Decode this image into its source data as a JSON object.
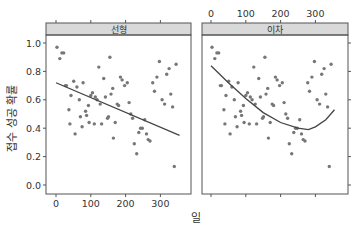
{
  "chart_data": {
    "type": "scatter",
    "title": "",
    "xlabel": "일",
    "ylabel": "접수 성공 확률",
    "xlim": [
      -30,
      385
    ],
    "ylim": [
      -0.05,
      1.08
    ],
    "x_ticks": [
      0,
      100,
      200,
      300
    ],
    "y_ticks": [
      0.0,
      0.2,
      0.4,
      0.6,
      0.8,
      1.0
    ],
    "y_tick_labels": [
      "0.0",
      "0.2",
      "0.4",
      "0.6",
      "0.8",
      "1.0"
    ],
    "grid": false,
    "panels": [
      {
        "name": "선형",
        "fit": "linear",
        "fit_line": {
          "x": [
            0,
            355
          ],
          "y": [
            0.72,
            0.35
          ]
        }
      },
      {
        "name": "이차",
        "fit": "quadratic",
        "fit_curve": {
          "x": [
            0,
            50,
            100,
            150,
            200,
            250,
            280,
            300,
            330,
            355
          ],
          "y": [
            0.84,
            0.72,
            0.61,
            0.51,
            0.44,
            0.4,
            0.39,
            0.41,
            0.46,
            0.53
          ]
        }
      }
    ],
    "points": {
      "x": [
        3,
        11,
        17,
        22,
        27,
        30,
        37,
        40,
        43,
        51,
        55,
        60,
        67,
        70,
        75,
        78,
        85,
        88,
        93,
        95,
        100,
        105,
        110,
        113,
        118,
        123,
        127,
        131,
        137,
        142,
        148,
        151,
        155,
        158,
        163,
        165,
        170,
        176,
        180,
        185,
        190,
        197,
        205,
        210,
        215,
        220,
        225,
        232,
        238,
        243,
        248,
        255,
        260,
        265,
        270,
        278,
        283,
        290,
        297,
        305,
        312,
        318,
        325,
        330,
        335,
        340,
        345
      ],
      "y": [
        0.97,
        0.89,
        0.93,
        0.93,
        0.7,
        0.7,
        0.53,
        0.43,
        0.63,
        0.73,
        0.36,
        0.69,
        0.6,
        0.48,
        0.41,
        0.72,
        0.52,
        0.49,
        0.56,
        0.44,
        0.63,
        0.65,
        0.43,
        0.62,
        0.6,
        0.83,
        0.57,
        0.43,
        0.75,
        0.62,
        0.47,
        0.48,
        0.9,
        0.64,
        0.68,
        0.33,
        0.44,
        0.57,
        0.56,
        0.76,
        0.74,
        0.7,
        0.72,
        0.58,
        0.5,
        0.47,
        0.29,
        0.22,
        0.37,
        0.4,
        0.4,
        0.46,
        0.36,
        0.32,
        0.31,
        0.72,
        0.66,
        0.76,
        0.87,
        0.6,
        0.57,
        0.78,
        0.82,
        0.64,
        0.55,
        0.13,
        0.85
      ]
    }
  },
  "panels": [
    {
      "strip_label": "선형"
    },
    {
      "strip_label": "이차"
    }
  ],
  "axes": {
    "xlabel": "일",
    "ylabel": "접수 성공 확률",
    "x_tick_labels": [
      "0",
      "100",
      "200",
      "300"
    ],
    "y_tick_labels": [
      "0.0",
      "0.2",
      "0.4",
      "0.6",
      "0.8",
      "1.0"
    ]
  },
  "colors": {
    "strip_fill": "#d9d9d9",
    "border": "#555555",
    "point": "#777777",
    "fit_line": "#444444"
  }
}
